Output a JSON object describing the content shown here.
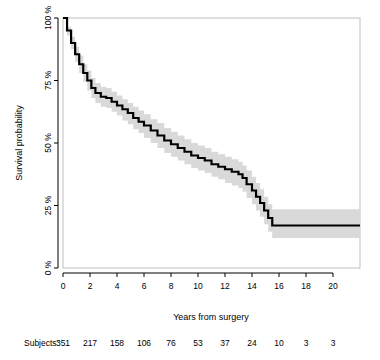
{
  "chart_data": {
    "type": "line",
    "subtype": "kaplan-meier-step",
    "title": "",
    "xlabel": "Years from surgery",
    "ylabel": "Survival probability",
    "xlim": [
      0,
      22
    ],
    "ylim": [
      0,
      100
    ],
    "grid": false,
    "legend": null,
    "xticks": [
      0,
      2,
      4,
      6,
      8,
      10,
      12,
      14,
      16,
      18,
      20
    ],
    "xtick_labels": [
      "0",
      "2",
      "4",
      "6",
      "8",
      "10",
      "12",
      "14",
      "16",
      "18",
      "20"
    ],
    "yticks": [
      0,
      25,
      50,
      75,
      100
    ],
    "ytick_labels": [
      "0 %",
      "25 %",
      "50 %",
      "75 %",
      "100 %"
    ],
    "colors": {
      "curve": "#000000",
      "confidence_band": "#d9d9d9",
      "axis": "#000000",
      "frame": "#bfbfbf"
    },
    "series": [
      {
        "name": "Survival estimate",
        "style": "step",
        "x": [
          0.0,
          0.3,
          0.6,
          0.9,
          1.2,
          1.5,
          1.8,
          2.1,
          2.4,
          2.8,
          3.2,
          3.6,
          4.0,
          4.4,
          4.8,
          5.2,
          5.6,
          6.0,
          6.5,
          7.0,
          7.5,
          8.0,
          8.5,
          9.0,
          9.5,
          10.0,
          10.5,
          11.0,
          11.5,
          12.0,
          12.5,
          13.0,
          13.3,
          13.6,
          14.0,
          14.3,
          14.6,
          14.9,
          15.2,
          15.5,
          16.0,
          18.0,
          20.0,
          22.0
        ],
        "y": [
          100.0,
          95.0,
          90.0,
          85.5,
          81.5,
          78.0,
          75.0,
          72.0,
          70.0,
          68.5,
          68.0,
          66.5,
          65.0,
          63.5,
          62.0,
          60.0,
          58.5,
          57.0,
          55.0,
          53.0,
          51.0,
          49.5,
          48.0,
          46.5,
          45.0,
          44.0,
          43.0,
          41.5,
          40.5,
          39.5,
          38.5,
          37.5,
          36.0,
          33.5,
          31.0,
          28.5,
          26.0,
          23.0,
          20.0,
          17.0,
          17.0,
          17.0,
          17.0,
          17.0
        ]
      }
    ],
    "confidence_band": {
      "name": "95% confidence interval",
      "x": [
        0.0,
        0.3,
        0.6,
        0.9,
        1.2,
        1.5,
        1.8,
        2.1,
        2.4,
        2.8,
        3.2,
        3.6,
        4.0,
        4.4,
        4.8,
        5.2,
        5.6,
        6.0,
        6.5,
        7.0,
        7.5,
        8.0,
        8.5,
        9.0,
        9.5,
        10.0,
        10.5,
        11.0,
        11.5,
        12.0,
        12.5,
        13.0,
        13.3,
        13.6,
        14.0,
        14.3,
        14.6,
        14.9,
        15.2,
        15.5,
        16.0,
        18.0,
        20.0,
        22.0
      ],
      "lower": [
        100.0,
        93.0,
        87.5,
        82.5,
        78.0,
        74.5,
        71.0,
        68.0,
        66.0,
        64.5,
        64.0,
        62.5,
        61.0,
        59.0,
        57.5,
        55.5,
        54.0,
        52.0,
        50.0,
        48.0,
        46.0,
        44.5,
        43.0,
        41.5,
        40.0,
        39.0,
        38.0,
        36.5,
        35.5,
        34.0,
        33.0,
        32.0,
        30.5,
        28.0,
        25.5,
        23.0,
        20.5,
        17.5,
        14.5,
        12.0,
        12.0,
        12.0,
        12.0,
        12.0
      ],
      "upper": [
        100.0,
        96.5,
        92.5,
        88.5,
        85.0,
        81.5,
        79.0,
        76.0,
        74.0,
        72.5,
        72.0,
        70.5,
        69.0,
        67.5,
        66.0,
        64.5,
        63.0,
        61.5,
        59.5,
        58.0,
        56.0,
        54.5,
        53.0,
        51.5,
        50.0,
        49.0,
        48.0,
        46.5,
        45.5,
        44.5,
        43.5,
        42.5,
        41.0,
        39.0,
        36.5,
        34.0,
        31.5,
        28.5,
        25.5,
        23.5,
        23.5,
        23.5,
        23.5,
        23.5
      ]
    }
  },
  "risk_table": {
    "label": "Subjects:",
    "times": [
      0,
      2,
      4,
      6,
      8,
      10,
      12,
      14,
      16,
      18,
      20
    ],
    "counts": [
      "351",
      "217",
      "158",
      "106",
      "76",
      "53",
      "37",
      "24",
      "10",
      "3",
      "3"
    ]
  }
}
